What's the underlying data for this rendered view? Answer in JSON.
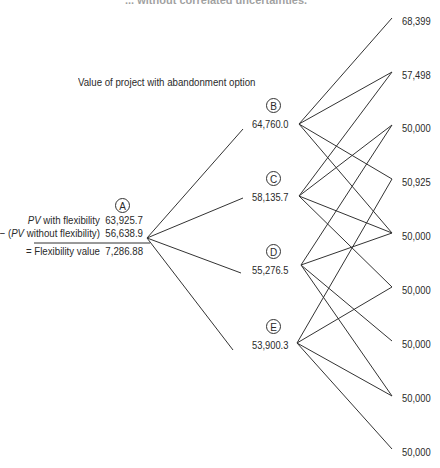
{
  "title": "... without correlated uncertainties.",
  "subtitle": "Value of project with abandonment option",
  "root": {
    "label": "A",
    "rows": [
      {
        "prefix": "",
        "italic": "PV",
        "text": " with flexibility",
        "value": "63,925.7"
      },
      {
        "prefix": "− (",
        "italic": "PV",
        "text": " without flexibility)",
        "value": "56,638.9"
      },
      {
        "prefix": "= ",
        "italic": "",
        "text": "Flexibility value",
        "value": "7,286.88"
      }
    ]
  },
  "nodes": [
    {
      "label": "B",
      "value": "64,760.0"
    },
    {
      "label": "C",
      "value": "58,135.7"
    },
    {
      "label": "D",
      "value": "55,276.5"
    },
    {
      "label": "E",
      "value": "53,900.3"
    }
  ],
  "terminals": [
    "68,399",
    "57,498",
    "50,000",
    "50,925",
    "50,000",
    "50,000",
    "50,000",
    "50,000",
    "50,000"
  ],
  "colors": {
    "line": "#333333",
    "text": "#2a2a2a"
  }
}
